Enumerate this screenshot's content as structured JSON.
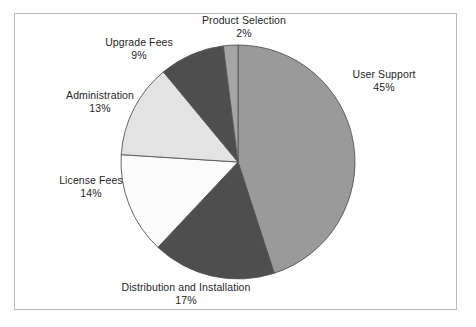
{
  "figure": {
    "background_color": "#fdfdfd",
    "frame_border_color": "#b9b9b9",
    "frame_background": "#ffffff"
  },
  "chart_data": {
    "type": "pie",
    "title": "",
    "subtitle": "",
    "xlabel": "",
    "ylabel": "",
    "legend_position": "none",
    "grid": false,
    "labels_outside": true,
    "label_format": "name above percent",
    "start_angle_deg": 0,
    "direction": "clockwise",
    "total_percent": 100,
    "categories": [
      "User Support",
      "Distribution and Installation",
      "License Fees",
      "Administration",
      "Upgrade Fees",
      "Product Selection"
    ],
    "values": [
      45,
      17,
      14,
      13,
      9,
      2
    ],
    "value_labels": [
      "45%",
      "17%",
      "14%",
      "13%",
      "9%",
      "2%"
    ],
    "colors": [
      "#9a9a9a",
      "#4e4e4e",
      "#fbfbfb",
      "#e3e3e3",
      "#4e4e4e",
      "#a5a5a5"
    ],
    "slice_edge_color": "#555555",
    "slices": [
      {
        "name": "User Support",
        "value": 45,
        "value_label": "45%",
        "color": "#9a9a9a"
      },
      {
        "name": "Distribution and Installation",
        "value": 17,
        "value_label": "17%",
        "color": "#4e4e4e"
      },
      {
        "name": "License Fees",
        "value": 14,
        "value_label": "14%",
        "color": "#fbfbfb"
      },
      {
        "name": "Administration",
        "value": 13,
        "value_label": "13%",
        "color": "#e3e3e3"
      },
      {
        "name": "Upgrade Fees",
        "value": 9,
        "value_label": "9%",
        "color": "#4e4e4e"
      },
      {
        "name": "Product Selection",
        "value": 2,
        "value_label": "2%",
        "color": "#a5a5a5"
      }
    ],
    "geometry": {
      "center_x": 238,
      "center_y": 162,
      "radius": 117
    }
  }
}
